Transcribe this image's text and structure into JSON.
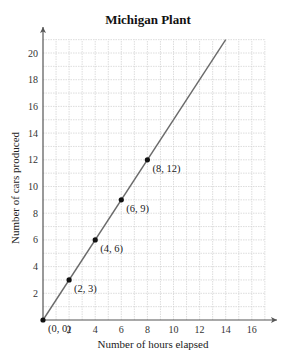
{
  "chart_data": {
    "type": "line",
    "title": "Michigan Plant",
    "xlabel": "Number of hours elapsed",
    "ylabel": "Number of cars produced",
    "x_ticks": [
      2,
      4,
      6,
      8,
      10,
      12,
      14,
      16
    ],
    "y_ticks": [
      2,
      4,
      6,
      8,
      10,
      12,
      14,
      16,
      18,
      20
    ],
    "xlim": [
      0,
      17
    ],
    "ylim": [
      0,
      21
    ],
    "grid": true,
    "grid_step": 1,
    "legend": null,
    "series": [
      {
        "name": "Michigan Plant",
        "equation": "y = 1.5x",
        "line_start": [
          0,
          0
        ],
        "line_end": [
          14,
          21
        ],
        "x": [
          0,
          2,
          4,
          6,
          8
        ],
        "y": [
          0,
          3,
          6,
          9,
          12
        ]
      }
    ],
    "annotations": [
      {
        "text": "(0, 0)",
        "x": 0,
        "y": 0
      },
      {
        "text": "(2, 3)",
        "x": 2,
        "y": 3
      },
      {
        "text": "(4, 6)",
        "x": 4,
        "y": 6
      },
      {
        "text": "(6, 9)",
        "x": 6,
        "y": 9
      },
      {
        "text": "(8, 12)",
        "x": 8,
        "y": 12
      }
    ]
  }
}
